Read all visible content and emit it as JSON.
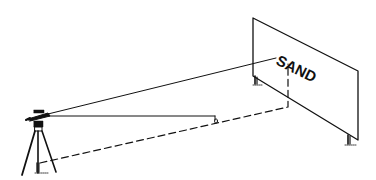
{
  "figure": {
    "board_text": "SAND",
    "colors": {
      "ink": "#111111",
      "background": "#ffffff"
    }
  }
}
